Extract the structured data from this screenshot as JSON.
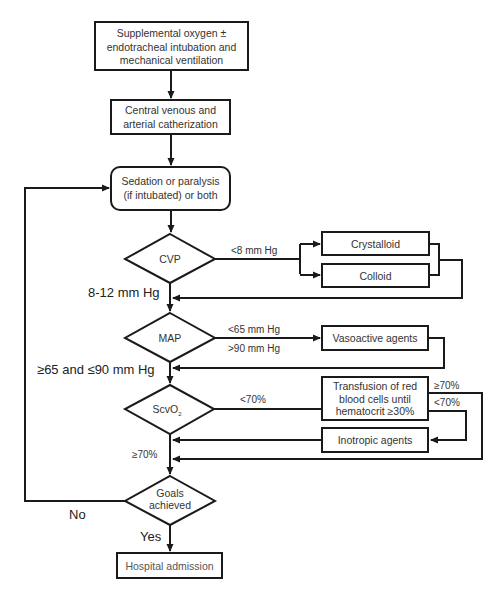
{
  "diagram": {
    "nodes": {
      "oxygen": {
        "lines": [
          "Supplemental oxygen ±",
          "endotracheal intubation and",
          "mechanical ventilation"
        ]
      },
      "catheter": {
        "lines": [
          "Central venous and",
          "arterial catherization"
        ]
      },
      "sedation": {
        "lines": [
          "Sedation or paralysis",
          "(if intubated) or both"
        ]
      },
      "cvp": {
        "label": "CVP"
      },
      "crystalloid": {
        "label": "Crystalloid"
      },
      "colloid": {
        "label": "Colloid"
      },
      "map": {
        "label": "MAP"
      },
      "vasoactive": {
        "label": "Vasoactive agents"
      },
      "scvo2": {
        "label": "ScvO",
        "subscript": "2"
      },
      "transfusion": {
        "lines": [
          "Transfusion of red",
          "blood cells until",
          "hematocrit ≥30%"
        ]
      },
      "inotropic": {
        "label": "Inotropic agents"
      },
      "goals": {
        "lines": [
          "Goals",
          "achieved"
        ]
      },
      "hospital": {
        "label": "Hospital admission"
      }
    },
    "edge_labels": {
      "cvp_low": "<8 mm Hg",
      "cvp_ok": "8-12 mm Hg",
      "map_low": "<65 mm Hg",
      "map_high": ">90 mm Hg",
      "map_ok": "≥65 and ≤90 mm Hg",
      "scvo2_low": "<70%",
      "scvo2_ok": "≥70%",
      "transfusion_ok": "≥70%",
      "transfusion_low": "<70%",
      "goals_no": "No",
      "goals_yes": "Yes"
    },
    "colors": {
      "stroke": "#1a1a1a",
      "text": "#333333",
      "background": "#ffffff"
    }
  }
}
